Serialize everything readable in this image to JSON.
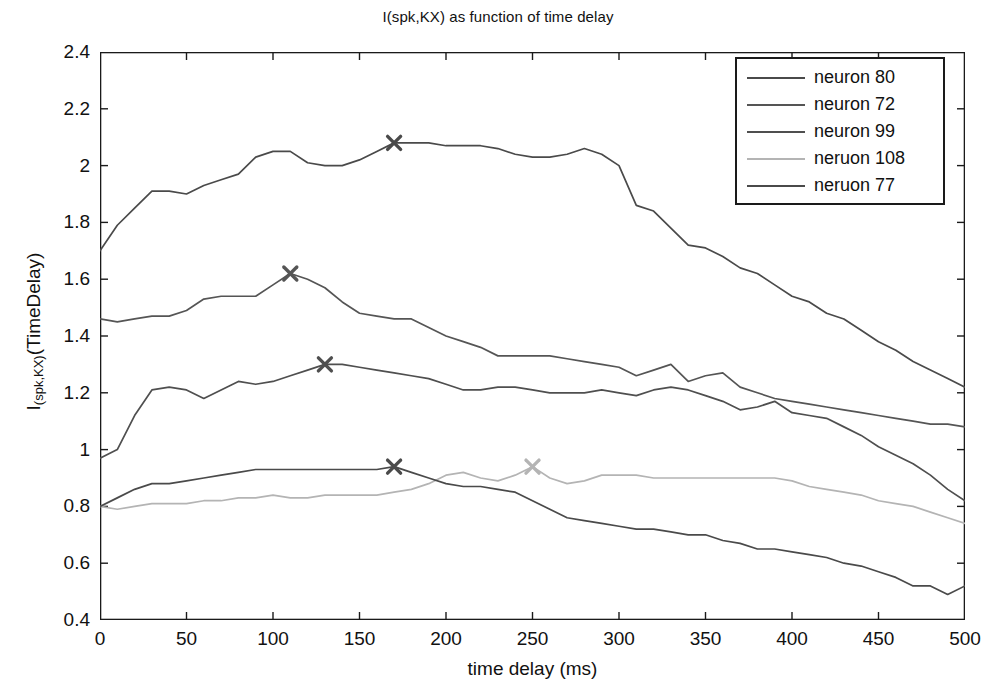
{
  "chart_data": {
    "type": "line",
    "title": "I(spk,KX) as function of time delay",
    "xlabel": "time delay (ms)",
    "ylabel_main": "I",
    "ylabel_sub": "(spk,KX)",
    "ylabel_tail": "(TimeDelay)",
    "xlim": [
      0,
      500
    ],
    "ylim": [
      0.4,
      2.4
    ],
    "xticks": [
      0,
      50,
      100,
      150,
      200,
      250,
      300,
      350,
      400,
      450,
      500
    ],
    "yticks": [
      "0.4",
      "0.6",
      "0.8",
      "1",
      "1.2",
      "1.4",
      "1.6",
      "1.8",
      "2",
      "2.2",
      "2.4"
    ],
    "ytick_values": [
      0.4,
      0.6,
      0.8,
      1.0,
      1.2,
      1.4,
      1.6,
      1.8,
      2.0,
      2.2,
      2.4
    ],
    "grid": false,
    "legend_position": "top-right",
    "x": [
      0,
      10,
      20,
      30,
      40,
      50,
      60,
      70,
      80,
      90,
      100,
      110,
      120,
      130,
      140,
      150,
      160,
      170,
      180,
      190,
      200,
      210,
      220,
      230,
      240,
      250,
      260,
      270,
      280,
      290,
      300,
      310,
      320,
      330,
      340,
      350,
      360,
      370,
      380,
      390,
      400,
      410,
      420,
      430,
      440,
      450,
      460,
      470,
      480,
      490,
      500
    ],
    "series": [
      {
        "name": "neuron 80",
        "color": "#4a4a4a",
        "marker": {
          "x": 170,
          "y": 2.08,
          "symbol": "x"
        },
        "values": [
          1.7,
          1.79,
          1.85,
          1.91,
          1.91,
          1.9,
          1.93,
          1.95,
          1.97,
          2.03,
          2.05,
          2.05,
          2.01,
          2.0,
          2.0,
          2.02,
          2.05,
          2.08,
          2.08,
          2.08,
          2.07,
          2.07,
          2.07,
          2.06,
          2.04,
          2.03,
          2.03,
          2.04,
          2.06,
          2.04,
          2.0,
          1.86,
          1.84,
          1.78,
          1.72,
          1.71,
          1.68,
          1.64,
          1.62,
          1.58,
          1.54,
          1.52,
          1.48,
          1.46,
          1.42,
          1.38,
          1.35,
          1.31,
          1.28,
          1.25,
          1.22
        ]
      },
      {
        "name": "neuron 72",
        "color": "#555555",
        "marker": {
          "x": 110,
          "y": 1.62,
          "symbol": "x"
        },
        "values": [
          1.46,
          1.45,
          1.46,
          1.47,
          1.47,
          1.49,
          1.53,
          1.54,
          1.54,
          1.54,
          1.58,
          1.62,
          1.6,
          1.57,
          1.52,
          1.48,
          1.47,
          1.46,
          1.46,
          1.43,
          1.4,
          1.38,
          1.36,
          1.33,
          1.33,
          1.33,
          1.33,
          1.32,
          1.31,
          1.3,
          1.29,
          1.26,
          1.28,
          1.3,
          1.24,
          1.26,
          1.27,
          1.22,
          1.2,
          1.18,
          1.17,
          1.16,
          1.15,
          1.14,
          1.13,
          1.12,
          1.11,
          1.1,
          1.09,
          1.09,
          1.08
        ]
      },
      {
        "name": "neuron 99",
        "color": "#4f4f4f",
        "marker": {
          "x": 130,
          "y": 1.3,
          "symbol": "x"
        },
        "values": [
          0.97,
          1.0,
          1.12,
          1.21,
          1.22,
          1.21,
          1.18,
          1.21,
          1.24,
          1.23,
          1.24,
          1.26,
          1.28,
          1.3,
          1.3,
          1.29,
          1.28,
          1.27,
          1.26,
          1.25,
          1.23,
          1.21,
          1.21,
          1.22,
          1.22,
          1.21,
          1.2,
          1.2,
          1.2,
          1.21,
          1.2,
          1.19,
          1.21,
          1.22,
          1.21,
          1.19,
          1.17,
          1.14,
          1.15,
          1.17,
          1.13,
          1.12,
          1.11,
          1.08,
          1.05,
          1.01,
          0.98,
          0.95,
          0.91,
          0.86,
          0.82
        ]
      },
      {
        "name": "neruon 108",
        "color": "#b4b4b4",
        "marker": {
          "x": 250,
          "y": 0.94,
          "symbol": "x"
        },
        "values": [
          0.8,
          0.79,
          0.8,
          0.81,
          0.81,
          0.81,
          0.82,
          0.82,
          0.83,
          0.83,
          0.84,
          0.83,
          0.83,
          0.84,
          0.84,
          0.84,
          0.84,
          0.85,
          0.86,
          0.88,
          0.91,
          0.92,
          0.9,
          0.89,
          0.91,
          0.94,
          0.9,
          0.88,
          0.89,
          0.91,
          0.91,
          0.91,
          0.9,
          0.9,
          0.9,
          0.9,
          0.9,
          0.9,
          0.9,
          0.9,
          0.89,
          0.87,
          0.86,
          0.85,
          0.84,
          0.82,
          0.81,
          0.8,
          0.78,
          0.76,
          0.74
        ]
      },
      {
        "name": "neruon 77",
        "color": "#4a4a4a",
        "marker": {
          "x": 170,
          "y": 0.94,
          "symbol": "x"
        },
        "values": [
          0.8,
          0.83,
          0.86,
          0.88,
          0.88,
          0.89,
          0.9,
          0.91,
          0.92,
          0.93,
          0.93,
          0.93,
          0.93,
          0.93,
          0.93,
          0.93,
          0.93,
          0.94,
          0.92,
          0.9,
          0.88,
          0.87,
          0.87,
          0.86,
          0.85,
          0.82,
          0.79,
          0.76,
          0.75,
          0.74,
          0.73,
          0.72,
          0.72,
          0.71,
          0.7,
          0.7,
          0.68,
          0.67,
          0.65,
          0.65,
          0.64,
          0.63,
          0.62,
          0.6,
          0.59,
          0.57,
          0.55,
          0.52,
          0.52,
          0.49,
          0.52
        ]
      }
    ]
  },
  "legend": {
    "items": [
      {
        "label": "neuron 80"
      },
      {
        "label": "neuron 72"
      },
      {
        "label": "neuron 99"
      },
      {
        "label": "neruon 108"
      },
      {
        "label": "neruon 77"
      }
    ]
  }
}
